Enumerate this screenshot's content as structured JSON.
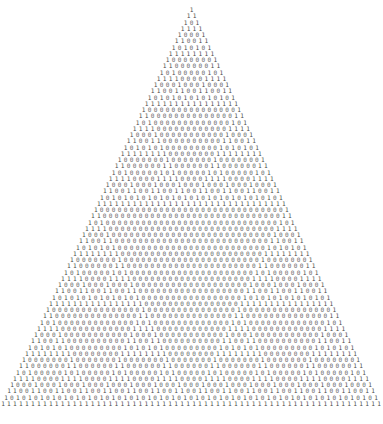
{
  "figure": {
    "name": "pascal-triangle-mod-2",
    "title": "",
    "background_color": "#ffffff",
    "digit_one_color": "#4a4a4a",
    "digit_zero_color": "#6e6e6e"
  },
  "chart_data": {
    "type": "table",
    "title": "",
    "subtitle": "",
    "xlabel": "",
    "ylabel": "",
    "rows": 64,
    "modulus": 2,
    "alphabet": [
      "0",
      "1"
    ],
    "first_row": "1",
    "last_row": "1111111111111111111111111111111111111111111111111111111111111111",
    "sample_rows": [
      "1",
      "11",
      "101",
      "1111",
      "10001",
      "110011",
      "1010101",
      "11111111",
      "100000001",
      "1100000011",
      "10100000101",
      "111100001111",
      "1000100010001",
      "11001100110011",
      "101010101010101",
      "1111111111111111"
    ],
    "layout": {
      "char_width_px": 5.984,
      "row_pitch_px": 6.25,
      "top_offset_px": 7,
      "centered": true,
      "grid": false,
      "legend": "none"
    }
  }
}
